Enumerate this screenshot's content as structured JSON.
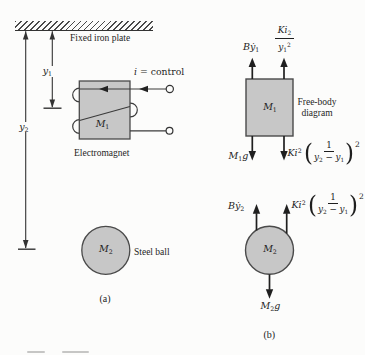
{
  "figure": {
    "panel_a": {
      "plate_label": "Fixed iron plate",
      "y1_label": [
        [
          "i",
          "y"
        ],
        [
          "sb",
          "1"
        ]
      ],
      "y2_label": [
        [
          "i",
          "y"
        ],
        [
          "sb",
          "2"
        ]
      ],
      "current_label": [
        [
          "i",
          "i"
        ],
        [
          "r",
          " = control"
        ]
      ],
      "magnet_mass_label": [
        [
          "i",
          "M"
        ],
        [
          "sb",
          "1"
        ]
      ],
      "electromagnet_caption": "Electromagnet",
      "ball_mass_label": [
        [
          "i",
          "M"
        ],
        [
          "sb",
          "2"
        ]
      ],
      "steel_ball_caption": "Steel ball",
      "caption": "(a)"
    },
    "panel_b": {
      "fbd_caption_line1": "Free-body",
      "fbd_caption_line2": "diagram",
      "caption": "(b)",
      "magnet_fbd": {
        "mass_label": [
          [
            "i",
            "M"
          ],
          [
            "sb",
            "1"
          ]
        ],
        "damping_force": [
          [
            "i",
            "B"
          ],
          [
            "i",
            "ẏ"
          ],
          [
            "sb",
            "1"
          ]
        ],
        "plate_attraction_num": [
          [
            "i",
            "K"
          ],
          [
            "i",
            "i"
          ],
          [
            "sb",
            "2"
          ]
        ],
        "plate_attraction_den": [
          [
            "i",
            "y"
          ],
          [
            "sb",
            "1"
          ],
          [
            "sp",
            "2"
          ]
        ],
        "weight": [
          [
            "i",
            "M"
          ],
          [
            "sb",
            "1"
          ],
          [
            "i",
            "g"
          ]
        ],
        "ball_reaction_coef": [
          [
            "i",
            "K"
          ],
          [
            "i",
            "i"
          ],
          [
            "sp",
            "2"
          ]
        ],
        "ball_reaction_inner_num": [
          [
            "r",
            "1"
          ]
        ],
        "ball_reaction_inner_den": [
          [
            "i",
            "y"
          ],
          [
            "sb",
            "2"
          ],
          [
            "r",
            " − "
          ],
          [
            "i",
            "y"
          ],
          [
            "sb",
            "1"
          ]
        ],
        "ball_reaction_exponent": "2"
      },
      "ball_fbd": {
        "mass_label": [
          [
            "i",
            "M"
          ],
          [
            "sb",
            "2"
          ]
        ],
        "damping_force": [
          [
            "i",
            "B"
          ],
          [
            "i",
            "ẏ"
          ],
          [
            "sb",
            "2"
          ]
        ],
        "magnet_attraction_coef": [
          [
            "i",
            "K"
          ],
          [
            "i",
            "i"
          ],
          [
            "sp",
            "2"
          ]
        ],
        "magnet_attraction_inner_num": [
          [
            "r",
            "1"
          ]
        ],
        "magnet_attraction_inner_den": [
          [
            "i",
            "y"
          ],
          [
            "sb",
            "2"
          ],
          [
            "r",
            " − "
          ],
          [
            "i",
            "y"
          ],
          [
            "sb",
            "1"
          ]
        ],
        "magnet_attraction_exponent": "2",
        "weight": [
          [
            "i",
            "M"
          ],
          [
            "sb",
            "2"
          ],
          [
            "i",
            "g"
          ]
        ]
      }
    },
    "symbols": {
      "open_paren": "(",
      "close_paren": ")"
    },
    "colors": {
      "body_fill": "#c7c7c7",
      "stroke": "#3b3b3b",
      "text": "#1e1e1e",
      "background": "#fcfcfb"
    }
  }
}
